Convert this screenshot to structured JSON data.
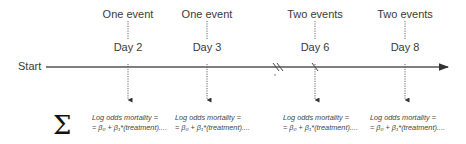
{
  "timeline": {
    "start_label": "Start",
    "events": [
      {
        "event_label": "One event",
        "day_label": "Day 2",
        "x": 128
      },
      {
        "event_label": "One event",
        "day_label": "Day 3",
        "x": 207
      },
      {
        "event_label": "Two events",
        "day_label": "Day 6",
        "x": 315
      },
      {
        "event_label": "Two events",
        "day_label": "Day 8",
        "x": 405
      }
    ],
    "axis_break": "//"
  },
  "summation": {
    "symbol": "Σ",
    "formulas": [
      {
        "line1": "Log odds mortality =",
        "line2": "= β₀ + β₁*(treatment)...."
      },
      {
        "line1": "Log odds mortality =",
        "line2": "= β₀ + β₁*(treatment)...."
      },
      {
        "line1": "Log odds mortality =",
        "line2": "= β₀ + β₁*(treatment)...."
      },
      {
        "line1": "Log odds mortality =",
        "line2": "= β₀ + β₁*(treatment)...."
      }
    ]
  },
  "colors": {
    "line": "#555555",
    "text": "#3a3a3a"
  }
}
